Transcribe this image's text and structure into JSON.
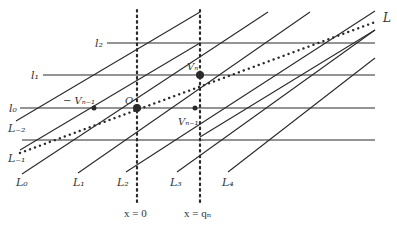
{
  "diagram": {
    "colors": {
      "ink": "#2a2a2a",
      "background": "#ffffff"
    },
    "horizontal_lines": [
      {
        "id": "l2",
        "label": "l₂",
        "y": 43,
        "x1": 107,
        "x2": 375,
        "label_x": 95,
        "label_y": 47
      },
      {
        "id": "l1",
        "label": "l₁",
        "y": 75,
        "x1": 43,
        "x2": 375,
        "label_x": 31,
        "label_y": 79
      },
      {
        "id": "l0",
        "label": "l₀",
        "y": 108,
        "x1": 20,
        "x2": 375,
        "label_x": 9,
        "label_y": 112
      },
      {
        "id": "l-1",
        "label": "",
        "y": 140,
        "x1": 22,
        "x2": 375
      }
    ],
    "diagonal_lines": [
      {
        "id": "L-2",
        "label": "L₋₂",
        "x1": 16,
        "y1": 121,
        "x2": 200,
        "y2": 12,
        "label_x": 8,
        "label_y": 132
      },
      {
        "id": "L-1",
        "label": "L₋₁",
        "x1": 20,
        "y1": 150,
        "x2": 200,
        "y2": 43,
        "label_x": 8,
        "label_y": 162
      },
      {
        "id": "L0",
        "label": "L₀",
        "x1": 22,
        "y1": 174,
        "x2": 268,
        "y2": 12,
        "label_x": 16,
        "label_y": 186
      },
      {
        "id": "L1",
        "label": "L₁",
        "x1": 78,
        "y1": 173,
        "x2": 310,
        "y2": 12,
        "label_x": 73,
        "label_y": 186
      },
      {
        "id": "L2",
        "label": "L₂",
        "x1": 126,
        "y1": 172,
        "x2": 375,
        "y2": 11,
        "label_x": 117,
        "label_y": 186
      },
      {
        "id": "L3",
        "label": "L₃",
        "x1": 177,
        "y1": 172,
        "x2": 375,
        "y2": 30,
        "label_x": 170,
        "label_y": 186
      },
      {
        "id": "L4",
        "label": "L₄",
        "x1": 228,
        "y1": 172,
        "x2": 375,
        "y2": 58,
        "label_x": 222,
        "label_y": 186
      }
    ],
    "extra_segment": {
      "x1": 200,
      "y1": 137,
      "x2": 375,
      "y2": 30
    },
    "vertical_dotted": [
      {
        "id": "x0",
        "x": 137,
        "y1": 10,
        "y2": 205,
        "label": "x = 0",
        "label_x": 124,
        "label_y": 217
      },
      {
        "id": "xqn",
        "x": 200,
        "y1": 10,
        "y2": 205,
        "label": "x = qₙ",
        "label_x": 184,
        "label_y": 217
      }
    ],
    "line_L": {
      "label": "L",
      "x1": 20,
      "y1": 153,
      "x2": 378,
      "y2": 21,
      "label_x": 383,
      "label_y": 22
    },
    "points": [
      {
        "id": "O",
        "label": "O",
        "cx": 137,
        "cy": 108,
        "r": 4,
        "label_x": 125,
        "label_y": 104
      },
      {
        "id": "Vn",
        "label": "Vₙ",
        "cx": 200,
        "cy": 75,
        "r": 4,
        "label_x": 187,
        "label_y": 70
      },
      {
        "id": "minus-Vn-1",
        "label": "− Vₙ₋₁",
        "cx": 94,
        "cy": 108,
        "r": 2.5,
        "label_x": 63,
        "label_y": 104
      },
      {
        "id": "Vn-1",
        "label": "Vₙ₋₁",
        "cx": 195,
        "cy": 108,
        "r": 2.5,
        "label_x": 178,
        "label_y": 125
      }
    ]
  }
}
